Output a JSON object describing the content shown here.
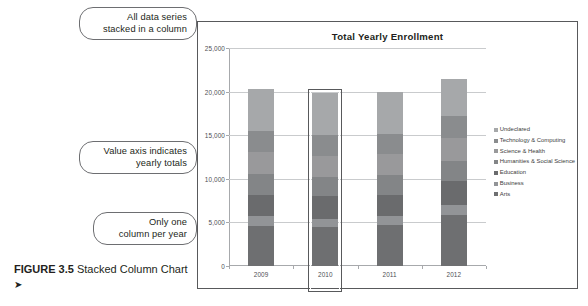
{
  "figure": {
    "label": "FIGURE 3.5",
    "title": "Stacked Column Chart",
    "arrow": "➤"
  },
  "callouts": [
    {
      "line1": "All data series",
      "line2": "stacked in a column"
    },
    {
      "line1": "Value axis indicates",
      "line2": "yearly totals"
    },
    {
      "line1": "Only one",
      "line2": "column per year"
    }
  ],
  "chart_data": {
    "type": "bar",
    "subtype": "stacked-column",
    "title": "Total Yearly Enrollment",
    "xlabel": "",
    "ylabel": "",
    "categories": [
      "2009",
      "2010",
      "2011",
      "2012"
    ],
    "ylim": [
      0,
      25000
    ],
    "yticks": [
      0,
      5000,
      10000,
      15000,
      20000,
      25000
    ],
    "ytick_labels": [
      "0",
      "5,000",
      "10,000",
      "15,000",
      "20,000",
      "25,000"
    ],
    "grid": true,
    "legend_position": "right",
    "series": [
      {
        "name": "Arts",
        "color": "#6e6f71",
        "values": [
          4600,
          4500,
          4700,
          5900
        ]
      },
      {
        "name": "Business",
        "color": "#929497",
        "values": [
          1100,
          900,
          1000,
          1100
        ]
      },
      {
        "name": "Education",
        "color": "#6a6b6d",
        "values": [
          2500,
          2600,
          2500,
          2700
        ]
      },
      {
        "name": "Humanities & Social Science",
        "color": "#838587",
        "values": [
          2300,
          2200,
          2200,
          2300
        ]
      },
      {
        "name": "Science & Health",
        "color": "#99999b",
        "values": [
          2600,
          2400,
          2500,
          2700
        ]
      },
      {
        "name": "Technology & Computing",
        "color": "#8a8c8e",
        "values": [
          2400,
          2400,
          2300,
          2500
        ]
      },
      {
        "name": "Undeclared",
        "color": "#a6a8aa",
        "values": [
          4800,
          4800,
          4800,
          4200
        ]
      }
    ],
    "totals": [
      20300,
      19800,
      20000,
      21400
    ],
    "highlighted_category": "2010"
  }
}
